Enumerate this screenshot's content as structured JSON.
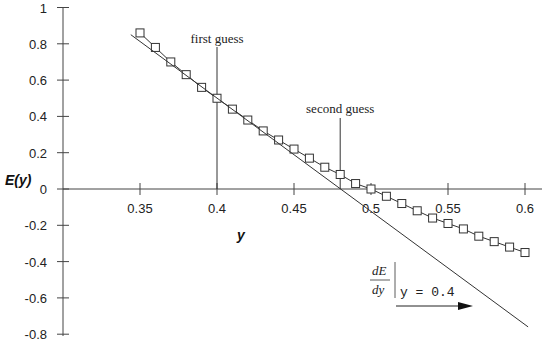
{
  "chart_data": {
    "type": "line",
    "title": "",
    "xlabel": "y",
    "ylabel": "E(y)",
    "xlim": [
      0.3,
      0.61
    ],
    "ylim": [
      -0.8,
      1.0
    ],
    "x_ticks": [
      0.35,
      0.4,
      0.45,
      0.5,
      0.55,
      0.6
    ],
    "x_tick_labels": [
      "0.35",
      "0.4",
      "0.45",
      "0.5",
      "0.55",
      "0.6"
    ],
    "y_ticks": [
      1,
      0.8,
      0.6,
      0.4,
      0.2,
      0,
      -0.2,
      -0.4,
      -0.6,
      -0.8
    ],
    "y_tick_labels": [
      "1",
      "0.8",
      "0.6",
      "0.4",
      "0.2",
      "0",
      "-0.2",
      "-0.4",
      "-0.6",
      "-0.8"
    ],
    "grid": false,
    "series": [
      {
        "name": "E(y)",
        "marker": "open-square",
        "x": [
          0.35,
          0.36,
          0.37,
          0.38,
          0.39,
          0.4,
          0.41,
          0.42,
          0.43,
          0.44,
          0.45,
          0.46,
          0.47,
          0.48,
          0.49,
          0.5,
          0.51,
          0.52,
          0.53,
          0.54,
          0.55,
          0.56,
          0.57,
          0.58,
          0.59,
          0.6
        ],
        "y": [
          0.86,
          0.78,
          0.7,
          0.63,
          0.56,
          0.5,
          0.44,
          0.38,
          0.32,
          0.27,
          0.22,
          0.17,
          0.12,
          0.08,
          0.03,
          0.0,
          -0.04,
          -0.08,
          -0.12,
          -0.16,
          -0.19,
          -0.22,
          -0.26,
          -0.29,
          -0.32,
          -0.35
        ]
      },
      {
        "name": "tangent at y = 0.4",
        "marker": "none",
        "x": [
          0.344,
          0.602
        ],
        "y": [
          0.85,
          -0.76
        ]
      }
    ],
    "annotations": [
      {
        "name": "first-guess",
        "text": "first guess",
        "x": 0.4
      },
      {
        "name": "second-guess",
        "text": "second guess",
        "x": 0.48
      }
    ],
    "derivative_label": {
      "numerator": "dE",
      "denominator": "dy",
      "evaluated_at": "y = 0.4"
    }
  }
}
